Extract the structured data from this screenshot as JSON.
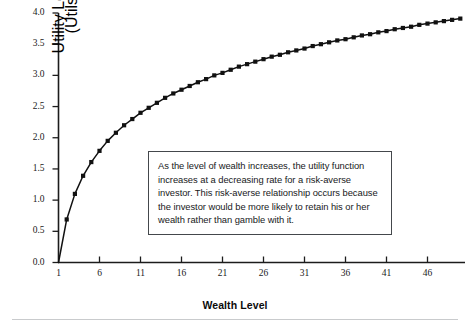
{
  "chart_data": {
    "type": "line",
    "title": "",
    "subtitle": "",
    "xlabel": "Wealth Level",
    "ylabel": "Utility Level (Utils)",
    "ylabel_lines": [
      "Utility Level",
      "(Utils)"
    ],
    "xlim": [
      1,
      50
    ],
    "ylim": [
      0.0,
      4.0
    ],
    "grid": false,
    "legend": null,
    "marker": "square",
    "series_color": "#111111",
    "series": [
      {
        "name": "Utility function (risk-averse)",
        "x": [
          1,
          2,
          3,
          4,
          5,
          6,
          7,
          8,
          9,
          10,
          11,
          12,
          13,
          14,
          15,
          16,
          17,
          18,
          19,
          20,
          21,
          22,
          23,
          24,
          25,
          26,
          27,
          28,
          29,
          30,
          31,
          32,
          33,
          34,
          35,
          36,
          37,
          38,
          39,
          40,
          41,
          42,
          43,
          44,
          45,
          46,
          47,
          48,
          49,
          50
        ],
        "values": [
          0.0,
          0.69,
          1.1,
          1.39,
          1.61,
          1.79,
          1.95,
          2.08,
          2.2,
          2.3,
          2.4,
          2.48,
          2.56,
          2.64,
          2.71,
          2.77,
          2.83,
          2.89,
          2.94,
          3.0,
          3.04,
          3.09,
          3.14,
          3.18,
          3.22,
          3.26,
          3.3,
          3.33,
          3.37,
          3.4,
          3.43,
          3.47,
          3.5,
          3.53,
          3.56,
          3.58,
          3.61,
          3.64,
          3.66,
          3.69,
          3.71,
          3.74,
          3.76,
          3.78,
          3.81,
          3.83,
          3.85,
          3.87,
          3.89,
          3.91
        ]
      }
    ],
    "yticks": [
      "0.0",
      "0.5",
      "1.0",
      "1.5",
      "2.0",
      "2.5",
      "3.0",
      "3.5",
      "4.0"
    ],
    "ytick_values": [
      0.0,
      0.5,
      1.0,
      1.5,
      2.0,
      2.5,
      3.0,
      3.5,
      4.0
    ],
    "xticks": [
      "1",
      "6",
      "11",
      "16",
      "21",
      "26",
      "31",
      "36",
      "41",
      "46"
    ],
    "xtick_values": [
      1,
      6,
      11,
      16,
      21,
      26,
      31,
      36,
      41,
      46
    ],
    "annotations": [
      {
        "name": "utility-explanation",
        "text": "As the level of wealth increases, the utility function increases at a decreasing rate for a risk-averse investor. This risk-averse relationship occurs because the investor would be more likely to retain his or her wealth rather than gamble with it."
      }
    ]
  },
  "colors": {
    "axis": "#1c1c1c",
    "curve": "#111111",
    "marker": "#111111",
    "text": "#17191b",
    "box_border": "#44484c",
    "rule": "#c9cbcd",
    "background": "#ffffff"
  }
}
